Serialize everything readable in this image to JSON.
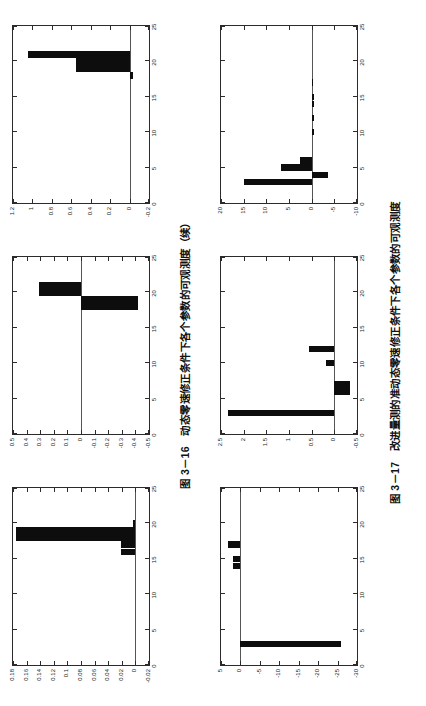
{
  "page": {
    "width": 426,
    "height": 706,
    "rotation_deg": -90,
    "background": "#ffffff",
    "ink_color": "#0d0d0d"
  },
  "figures": [
    {
      "id": "figure-3-16",
      "caption": "图 3－16　动态零速修正条件下各个参数的可观测度（续）",
      "caption_number": "图 3－16",
      "caption_text": "动态零速修正条件下各个参数的可观测度（续）"
    },
    {
      "id": "figure-3-17",
      "caption": "图 3－17　改进量测的准动态零速修正条件下各个参数的可观测度",
      "caption_number": "图 3－17",
      "caption_text": "改进量测的准动态零速修正条件下各个参数的可观测度"
    }
  ],
  "chart_data": [
    {
      "id": "chart-a",
      "type": "bar",
      "title": "奇异值=28.246 1",
      "singular_value_label": "奇异值=28.246 1",
      "singular_value": 28.2461,
      "xlabel": "",
      "ylabel": "",
      "xlim": [
        0,
        25
      ],
      "ylim": [
        -0.02,
        0.18
      ],
      "xticks": [
        0,
        5,
        10,
        15,
        20,
        25
      ],
      "xticklabels": [
        "0",
        "5",
        "10",
        "15",
        "20",
        "25"
      ],
      "yticks": [
        -0.02,
        0,
        0.02,
        0.04,
        0.06,
        0.08,
        0.1,
        0.12,
        0.14,
        0.16,
        0.18
      ],
      "yticklabels": [
        "-0.02",
        "0",
        "0.02",
        "0.04",
        "0.06",
        "0.08",
        "0.1",
        "0.12",
        "0.14",
        "0.16",
        "0.18"
      ],
      "grid": false,
      "categories": [
        1,
        2,
        3,
        4,
        5,
        6,
        7,
        8,
        9,
        10,
        11,
        12,
        13,
        14,
        15,
        16,
        17,
        18,
        19,
        20,
        21,
        22,
        23,
        24
      ],
      "values": [
        0,
        0,
        0,
        0,
        0,
        0,
        0,
        0,
        0,
        0,
        0,
        0,
        0,
        0,
        0,
        0.021,
        0.021,
        0.175,
        0.175,
        0.004,
        0,
        0,
        0,
        0
      ]
    },
    {
      "id": "chart-b",
      "type": "bar",
      "title": "奇异值=26.193 5",
      "singular_value_label": "奇异值=26.193 5",
      "singular_value": 26.1935,
      "xlabel": "",
      "ylabel": "",
      "xlim": [
        0,
        25
      ],
      "ylim": [
        -0.5,
        0.5
      ],
      "xticks": [
        0,
        5,
        10,
        15,
        20,
        25
      ],
      "xticklabels": [
        "0",
        "5",
        "10",
        "15",
        "20",
        "25"
      ],
      "yticks": [
        -0.5,
        -0.4,
        -0.3,
        -0.2,
        -0.1,
        0,
        0.1,
        0.2,
        0.3,
        0.4,
        0.5
      ],
      "yticklabels": [
        "-0.5",
        "-0.4",
        "-0.3",
        "-0.2",
        "-0.1",
        "0",
        "0.1",
        "0.2",
        "0.3",
        "0.4",
        "0.5"
      ],
      "grid": false,
      "categories": [
        1,
        2,
        3,
        4,
        5,
        6,
        7,
        8,
        9,
        10,
        11,
        12,
        13,
        14,
        15,
        16,
        17,
        18,
        19,
        20,
        21,
        22,
        23,
        24
      ],
      "values": [
        0,
        0,
        0,
        0,
        0,
        0,
        0,
        0,
        0,
        0,
        0,
        0,
        0,
        0,
        0,
        0,
        0,
        -0.42,
        -0.42,
        0.31,
        0.31,
        0,
        0,
        0
      ]
    },
    {
      "id": "chart-c",
      "type": "bar",
      "title": "奇异值=20.547 1",
      "singular_value_label": "奇异值=20.547 1",
      "singular_value": 20.5471,
      "xlabel": "",
      "ylabel": "",
      "xlim": [
        0,
        25
      ],
      "ylim": [
        -0.2,
        1.2
      ],
      "xticks": [
        0,
        5,
        10,
        15,
        20,
        25
      ],
      "xticklabels": [
        "0",
        "5",
        "10",
        "15",
        "20",
        "25"
      ],
      "yticks": [
        -0.2,
        0,
        0.2,
        0.4,
        0.6,
        0.8,
        1,
        1.2
      ],
      "yticklabels": [
        "-0.2",
        "0",
        "0.2",
        "0.4",
        "0.6",
        "0.8",
        "1",
        "1.2"
      ],
      "grid": false,
      "categories": [
        1,
        2,
        3,
        4,
        5,
        6,
        7,
        8,
        9,
        10,
        11,
        12,
        13,
        14,
        15,
        16,
        17,
        18,
        19,
        20,
        21,
        22,
        23,
        24
      ],
      "values": [
        0,
        0,
        0,
        0,
        0,
        0,
        0,
        0,
        0,
        0,
        0,
        0,
        0,
        0,
        0,
        0,
        0,
        -0.035,
        0.55,
        0.55,
        1.05,
        0,
        0,
        0
      ]
    },
    {
      "id": "chart-d",
      "type": "bar",
      "title": "奇异值=8.009",
      "singular_value_label": "奇异值=8.009",
      "singular_value": 8.009,
      "xlabel": "",
      "ylabel": "",
      "xlim": [
        0,
        25
      ],
      "ylim": [
        -30,
        5
      ],
      "xticks": [
        0,
        5,
        10,
        15,
        20,
        25
      ],
      "xticklabels": [
        "0",
        "5",
        "10",
        "15",
        "20",
        "25"
      ],
      "yticks": [
        -30,
        -25,
        -20,
        -15,
        -10,
        -5,
        0,
        5
      ],
      "yticklabels": [
        "-30",
        "-25",
        "-20",
        "-15",
        "-10",
        "-5",
        "0",
        "5"
      ],
      "grid": false,
      "categories": [
        1,
        2,
        3,
        4,
        5,
        6,
        7,
        8,
        9,
        10,
        11,
        12,
        13,
        14,
        15,
        16,
        17,
        18,
        19,
        20,
        21,
        22,
        23,
        24
      ],
      "values": [
        0,
        0,
        -26,
        0,
        0,
        0,
        0,
        0,
        0,
        0,
        0,
        0,
        0,
        2.0,
        2.0,
        0,
        3.2,
        0,
        0,
        0,
        0,
        0,
        0,
        0
      ]
    },
    {
      "id": "chart-e",
      "type": "bar",
      "title": "奇异值=16.529 8",
      "singular_value_label": "奇异值=16.529 8",
      "singular_value": 16.5298,
      "xlabel": "",
      "ylabel": "",
      "xlim": [
        0,
        25
      ],
      "ylim": [
        -0.5,
        2.5
      ],
      "xticks": [
        0,
        5,
        10,
        15,
        20,
        25
      ],
      "xticklabels": [
        "0",
        "5",
        "10",
        "15",
        "20",
        "25"
      ],
      "yticks": [
        -0.5,
        0,
        0.5,
        1,
        1.5,
        2,
        2.5
      ],
      "yticklabels": [
        "-0.5",
        "0",
        "0.5",
        "1",
        "1.5",
        "2",
        "2.5"
      ],
      "grid": false,
      "categories": [
        1,
        2,
        3,
        4,
        5,
        6,
        7,
        8,
        9,
        10,
        11,
        12,
        13,
        14,
        15,
        16,
        17,
        18,
        19,
        20,
        21,
        22,
        23,
        24
      ],
      "values": [
        0,
        0,
        2.35,
        0,
        0,
        -0.35,
        -0.35,
        0,
        0,
        0.18,
        0,
        0.55,
        0,
        0,
        0,
        0,
        0,
        0,
        0,
        0,
        0,
        0,
        0,
        0
      ]
    },
    {
      "id": "chart-f",
      "type": "bar",
      "title": "奇异值=41.422 8",
      "singular_value_label": "奇异值=41.422 8",
      "singular_value": 41.4228,
      "xlabel": "",
      "ylabel": "",
      "xlim": [
        0,
        25
      ],
      "ylim": [
        -10,
        20
      ],
      "xticks": [
        0,
        5,
        10,
        15,
        20,
        25
      ],
      "xticklabels": [
        "0",
        "5",
        "10",
        "15",
        "20",
        "25"
      ],
      "yticks": [
        -10,
        -5,
        0,
        5,
        10,
        15,
        20
      ],
      "yticklabels": [
        "-10",
        "-5",
        "0",
        "5",
        "10",
        "15",
        "20"
      ],
      "grid": false,
      "categories": [
        1,
        2,
        3,
        4,
        5,
        6,
        7,
        8,
        9,
        10,
        11,
        12,
        13,
        14,
        15,
        16,
        17,
        18,
        19,
        20,
        21,
        22,
        23,
        24
      ],
      "values": [
        0,
        0,
        15.0,
        -3.6,
        6.8,
        2.6,
        0,
        0,
        0,
        -0.6,
        0,
        -0.6,
        0,
        -0.5,
        -0.5,
        0,
        -0.4,
        0,
        0,
        0,
        0,
        0,
        0,
        0
      ]
    }
  ]
}
